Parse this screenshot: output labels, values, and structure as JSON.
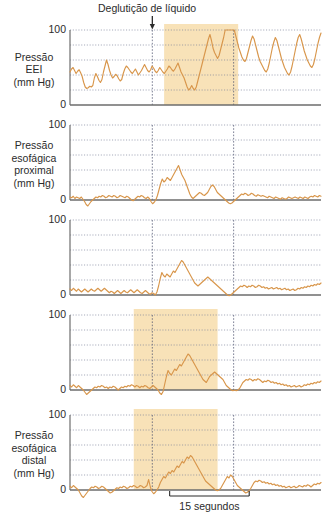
{
  "figure": {
    "annotation": "Deglutição de líquido",
    "arrow_icon": "down-arrow-icon",
    "scale_label": "15 segundos",
    "colors": {
      "trace": "#d8964b",
      "band": "#f8e2b8",
      "grid": "#7a7f99",
      "axis": "#6d6d6d",
      "text": "#2b2b2b"
    }
  },
  "chart_data": {
    "type": "line",
    "title": "Deglutição de líquido",
    "xlabel": "",
    "ylabel": "mm Hg",
    "ylim": [
      0,
      100
    ],
    "yticks": [
      0,
      100
    ],
    "gridlines_y": [
      20,
      40,
      60,
      80,
      100
    ],
    "grid": true,
    "legend": "none",
    "x_scale_bar": {
      "label": "15 segundos",
      "seconds": 15,
      "x_start_pct": 39.7,
      "x_end_pct": 71.4
    },
    "swallow_marker": {
      "label": "Deglutição de líquido",
      "x_pct": 32.8,
      "icon": "down-arrow-icon"
    },
    "vertical_markers_pct": [
      32.8,
      65.2
    ],
    "panels": [
      {
        "name": "pressao-eei",
        "label_lines": [
          "Pressão",
          "EEI",
          "(mm Hg)"
        ],
        "ytick_top": "100",
        "ytick_bottom": "0",
        "band_pct": [
          37.5,
          67.0
        ],
        "values": [
          44,
          48,
          50,
          46,
          42,
          45,
          47,
          43,
          38,
          30,
          24,
          22,
          23,
          25,
          24,
          26,
          36,
          42,
          38,
          33,
          30,
          34,
          44,
          52,
          60,
          54,
          46,
          40,
          36,
          38,
          41,
          39,
          35,
          32,
          34,
          42,
          48,
          52,
          50,
          47,
          44,
          42,
          45,
          48,
          44,
          40,
          43,
          46,
          50,
          54,
          50,
          46,
          44,
          47,
          52,
          49,
          45,
          43,
          46,
          50,
          47,
          44,
          42,
          45,
          48,
          52,
          50,
          47,
          45,
          48,
          52,
          56,
          50,
          44,
          40,
          36,
          30,
          24,
          20,
          22,
          26,
          22,
          20,
          24,
          32,
          40,
          48,
          56,
          64,
          72,
          80,
          88,
          94,
          86,
          76,
          70,
          66,
          62,
          66,
          74,
          82,
          90,
          100,
          110,
          118,
          124,
          120,
          112,
          102,
          92,
          84,
          76,
          70,
          64,
          60,
          58,
          62,
          70,
          78,
          86,
          92,
          88,
          80,
          72,
          64,
          58,
          54,
          50,
          46,
          44,
          48,
          56,
          66,
          76,
          84,
          90,
          86,
          78,
          70,
          62,
          56,
          50,
          46,
          42,
          40,
          44,
          52,
          62,
          72,
          82,
          90,
          94,
          88,
          80,
          72,
          66,
          60,
          56,
          52,
          50,
          54,
          62,
          72,
          82,
          90,
          96
        ]
      },
      {
        "name": "pressao-esofagica-proximal",
        "label_lines": [
          "Pressão",
          "esofágica",
          "proximal",
          "(mm Hg)"
        ],
        "ytick_top": "100",
        "ytick_bottom": "0",
        "band_pct": null,
        "values": [
          4,
          3,
          5,
          2,
          4,
          3,
          2,
          4,
          1,
          -2,
          -6,
          -8,
          -5,
          -2,
          0,
          2,
          4,
          3,
          5,
          4,
          6,
          5,
          3,
          4,
          6,
          5,
          4,
          6,
          5,
          3,
          4,
          6,
          5,
          4,
          3,
          5,
          4,
          2,
          0,
          -1,
          1,
          3,
          5,
          4,
          6,
          5,
          3,
          2,
          4,
          2,
          -2,
          -5,
          -3,
          0,
          6,
          14,
          22,
          28,
          24,
          26,
          30,
          28,
          26,
          30,
          34,
          38,
          42,
          46,
          40,
          34,
          30,
          26,
          20,
          14,
          8,
          4,
          2,
          4,
          6,
          8,
          10,
          9,
          7,
          6,
          8,
          10,
          14,
          18,
          20,
          18,
          14,
          10,
          8,
          6,
          4,
          2,
          0,
          -2,
          -4,
          -5,
          -4,
          -2,
          0,
          2,
          4,
          6,
          8,
          7,
          9,
          8,
          6,
          7,
          9,
          8,
          6,
          5,
          7,
          6,
          5,
          6,
          5,
          4,
          3,
          5,
          4,
          3,
          2,
          4,
          3,
          2,
          1,
          3,
          2,
          1,
          2,
          4,
          3,
          2,
          3,
          4,
          3,
          2,
          4,
          3,
          2,
          4,
          3,
          2,
          4,
          5,
          4,
          6,
          5,
          4,
          6,
          5
        ]
      },
      {
        "name": "pressao-esofagica-media",
        "label_lines": [],
        "ytick_top": "100",
        "ytick_bottom": "0",
        "band_pct": null,
        "values": [
          8,
          6,
          9,
          7,
          5,
          8,
          6,
          4,
          6,
          8,
          6,
          4,
          6,
          8,
          6,
          5,
          7,
          9,
          7,
          5,
          7,
          9,
          7,
          5,
          3,
          5,
          4,
          2,
          4,
          6,
          4,
          2,
          4,
          6,
          4,
          3,
          5,
          7,
          5,
          3,
          5,
          7,
          5,
          3,
          2,
          4,
          6,
          4,
          2,
          1,
          3,
          2,
          0,
          4,
          12,
          22,
          30,
          26,
          24,
          28,
          26,
          24,
          28,
          32,
          30,
          34,
          38,
          42,
          46,
          44,
          40,
          36,
          32,
          28,
          24,
          20,
          16,
          14,
          12,
          14,
          16,
          18,
          20,
          22,
          24,
          22,
          20,
          18,
          16,
          14,
          12,
          10,
          8,
          6,
          4,
          2,
          0,
          -1,
          0,
          2,
          4,
          6,
          8,
          10,
          12,
          11,
          13,
          12,
          10,
          12,
          11,
          13,
          12,
          10,
          11,
          13,
          12,
          10,
          11,
          9,
          10,
          8,
          9,
          10,
          8,
          9,
          10,
          8,
          9,
          7,
          8,
          9,
          7,
          8,
          6,
          7,
          8,
          6,
          7,
          9,
          8,
          10,
          9,
          11,
          10,
          12,
          11,
          13,
          12,
          14,
          13,
          15,
          14,
          16
        ]
      },
      {
        "name": "pressao-esofagica-distal-superior",
        "label_lines": [],
        "ytick_top": "100",
        "ytick_bottom": "0",
        "band_pct": [
          25.4,
          58.8
        ],
        "values": [
          6,
          4,
          7,
          5,
          3,
          6,
          4,
          2,
          0,
          -3,
          -6,
          -4,
          -2,
          0,
          2,
          4,
          3,
          5,
          4,
          6,
          5,
          3,
          4,
          2,
          4,
          3,
          5,
          4,
          2,
          0,
          2,
          4,
          3,
          5,
          4,
          6,
          5,
          7,
          6,
          4,
          6,
          5,
          3,
          5,
          4,
          6,
          5,
          3,
          2,
          4,
          6,
          4,
          2,
          0,
          -4,
          -6,
          -2,
          8,
          18,
          26,
          22,
          20,
          24,
          28,
          26,
          30,
          34,
          32,
          36,
          40,
          44,
          48,
          46,
          42,
          38,
          34,
          30,
          26,
          22,
          18,
          14,
          12,
          10,
          14,
          18,
          20,
          22,
          24,
          22,
          20,
          18,
          16,
          14,
          10,
          6,
          4,
          2,
          0,
          -1,
          0,
          -1,
          0,
          2,
          6,
          10,
          12,
          14,
          13,
          15,
          14,
          12,
          14,
          13,
          15,
          14,
          12,
          10,
          12,
          11,
          13,
          12,
          10,
          11,
          9,
          10,
          8,
          9,
          7,
          8,
          6,
          7,
          5,
          6,
          4,
          5,
          6,
          4,
          5,
          6,
          4,
          5,
          7,
          6,
          8,
          7,
          9,
          8,
          10,
          9,
          11,
          10,
          12
        ]
      },
      {
        "name": "pressao-esofagica-distal",
        "label_lines": [
          "Pressão",
          "esofágica",
          "distal",
          "(mm Hg)"
        ],
        "ytick_top": "100",
        "ytick_bottom": "0",
        "band_pct": [
          25.4,
          58.8
        ],
        "values": [
          5,
          3,
          6,
          4,
          2,
          0,
          -4,
          -8,
          -10,
          -7,
          -4,
          -1,
          2,
          4,
          3,
          5,
          4,
          2,
          3,
          5,
          4,
          2,
          0,
          -2,
          -4,
          -3,
          -1,
          1,
          3,
          2,
          4,
          3,
          5,
          4,
          2,
          3,
          5,
          4,
          6,
          5,
          3,
          4,
          6,
          5,
          3,
          4,
          6,
          14,
          4,
          -2,
          -5,
          -3,
          0,
          4,
          10,
          14,
          18,
          16,
          20,
          24,
          22,
          26,
          24,
          28,
          32,
          30,
          34,
          38,
          36,
          40,
          44,
          42,
          46,
          44,
          40,
          36,
          32,
          28,
          24,
          20,
          16,
          12,
          10,
          8,
          6,
          4,
          2,
          0,
          -1,
          0,
          2,
          6,
          10,
          14,
          18,
          16,
          20,
          18,
          14,
          10,
          6,
          4,
          2,
          0,
          -2,
          -4,
          -3,
          -1,
          2,
          6,
          10,
          12,
          11,
          13,
          12,
          10,
          11,
          9,
          10,
          8,
          9,
          7,
          8,
          6,
          7,
          5,
          6,
          4,
          5,
          3,
          4,
          5,
          3,
          4,
          5,
          3,
          4,
          6,
          5,
          4,
          6,
          5,
          7,
          6,
          4,
          6,
          8,
          7,
          9,
          8,
          10
        ]
      }
    ]
  }
}
